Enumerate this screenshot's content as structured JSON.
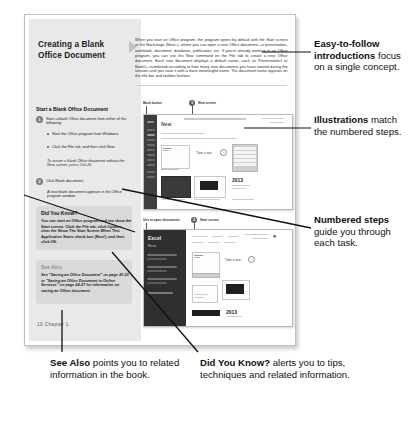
{
  "page": {
    "title": "Creating a Blank Office Document",
    "intro": "When you start an Office program, the program opens by default with the Start screen or the Backstage (New+), where you can open a new Office document—a presentation, workbook, document, database, publication, etc. If you're already working in an Office program, you can use the New command on the File tab to create a new Office document. Each new document displays a default name—such as Presentation1 or Book1—numbered according to how many new documents you have started during the session until you save it with a more meaningful name. The document name appears on the title bar and taskbar buttons.",
    "steps_heading": "Start a Blank Office Document",
    "steps": [
      {
        "num": "1",
        "text": "Start a blank Office document from either of the following:",
        "bullets": [
          {
            "lead": "Start Screen.",
            "text": "Start the Office program from Windows."
          },
          {
            "lead": "New Screen.",
            "text": "Click the File tab, and then click New."
          }
        ],
        "tip_label": "TIMESAVER",
        "tip_text": "To create a blank Office document without the New screen, press Ctrl+N."
      },
      {
        "num": "2",
        "text": "Click Blank document.",
        "result": "A new blank document appears in the Office program window."
      }
    ],
    "did_you_know_box": {
      "title": "Did You Know?",
      "body": "You can start an Office program and not show the Start screen. Click the File tab, click Options, clear the Show The Start Screen When This Application Starts check box (New!), and then click OK."
    },
    "see_also_box": {
      "title": "See Also",
      "body": "See \"Saving an Office Document\" on page 20-23 or \"Saving an Office Document to Online Services\" on page 24-27 for information on saving an Office document."
    },
    "footer": "10   Chapter 1"
  },
  "figures": [
    {
      "id": "new-screen",
      "labels": [
        {
          "text": "Back button"
        },
        {
          "badge": "1",
          "text": "New screen"
        }
      ],
      "rail_title": "Word",
      "rail_sub": "New",
      "tile_captions": [
        "Blank document",
        "Take a tour",
        "Title"
      ],
      "year": "2013"
    },
    {
      "id": "start-screen",
      "labels": [
        {
          "text": "Use to open documents"
        },
        {
          "badge": "2",
          "text": "Start screen"
        }
      ],
      "rail_title": "Excel",
      "rail_sub": "Recent",
      "tile_captions": [
        "Blank workbook",
        "Take a tour"
      ],
      "year": "2013"
    }
  ],
  "callouts": [
    {
      "id": "intro-callout",
      "bold": "Easy-to-follow introductions",
      "rest": " focus on a single concept."
    },
    {
      "id": "illustration-callout",
      "bold": "Illustrations",
      "rest": " match the numbered steps."
    },
    {
      "id": "steps-callout",
      "bold": "Numbered steps",
      "rest": " guide you through each task."
    },
    {
      "id": "see-also-callout",
      "bold": "See Also",
      "rest": " points you to related information in the book."
    },
    {
      "id": "did-you-know-callout",
      "bold": "Did You Know?",
      "rest": " alerts you to tips, techniques and related information."
    }
  ],
  "colors": {
    "page_bg": "#ffffff",
    "sidebar_bg": "#e9e9e9",
    "box_bg": "#d9d9d9",
    "ink": "#111111",
    "leader": "#111111"
  }
}
